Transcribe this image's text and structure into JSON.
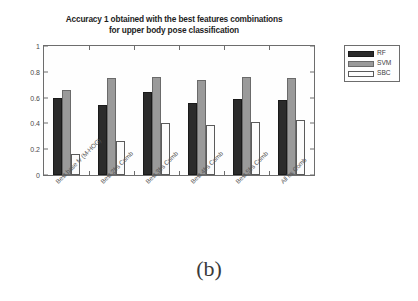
{
  "caption": "(b)",
  "legend": {
    "position": "right-outside",
    "entries": [
      {
        "label": "RF",
        "key": "rf",
        "color": "#2b2b2b",
        "swatch": "legend-swatch-rf"
      },
      {
        "label": "SVM",
        "key": "svm",
        "color": "#9a9a9a",
        "swatch": "legend-swatch-svm"
      },
      {
        "label": "SBC",
        "key": "sbc",
        "color": "#fdfdfd",
        "swatch": "legend-swatch-sbc"
      }
    ]
  },
  "chart_data": {
    "type": "bar",
    "title": "Accuracy 1 obtained with the best features combinations\nfor upper body pose classification",
    "xlabel": "",
    "ylabel": "",
    "ylim": [
      0,
      1
    ],
    "yticks": [
      0,
      0.2,
      0.4,
      0.6,
      0.8,
      1
    ],
    "ytick_labels": [
      "0",
      "0.2",
      "0.4",
      "0.6",
      "0.8",
      "1"
    ],
    "grid": false,
    "categories": [
      "Best base fv (M-HOG)",
      "Best 2frs Comb",
      "Best 3frs Comb",
      "Best 4frs Comb",
      "Best 5frs Comb",
      "All frs Comb"
    ],
    "series": [
      {
        "name": "RF",
        "color": "#2b2b2b",
        "values": [
          0.595,
          0.545,
          0.645,
          0.555,
          0.59,
          0.58
        ]
      },
      {
        "name": "SVM",
        "color": "#9a9a9a",
        "values": [
          0.66,
          0.75,
          0.76,
          0.74,
          0.76,
          0.75
        ]
      },
      {
        "name": "SBC",
        "color": "#fdfdfd",
        "values": [
          0.165,
          0.26,
          0.4,
          0.39,
          0.41,
          0.43
        ]
      }
    ]
  }
}
